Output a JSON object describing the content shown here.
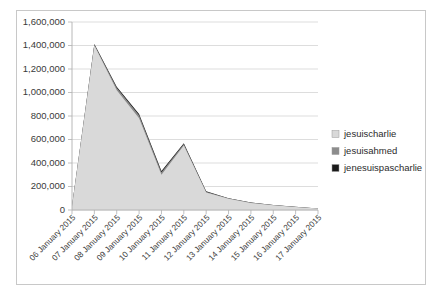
{
  "chart_data": {
    "type": "area",
    "stacked": true,
    "title": "",
    "subtitle": "",
    "xlabel": "",
    "ylabel": "",
    "grid": "horizontal",
    "legend_position": "right",
    "ylim": [
      0,
      1600000
    ],
    "ytick_values": [
      0,
      200000,
      400000,
      600000,
      800000,
      1000000,
      1200000,
      1400000,
      1600000
    ],
    "ytick_labels": [
      "0",
      "200,000",
      "400,000",
      "600,000",
      "800,000",
      "1,000,000",
      "1,200,000",
      "1,400,000",
      "1,600,000"
    ],
    "categories": [
      "06 January 2015",
      "07 January 2015",
      "08 January 2015",
      "09 January 2015",
      "10 January 2015",
      "11 January 2015",
      "12 January 2015",
      "13 January 2015",
      "14 January 2015",
      "15 January 2015",
      "16 January 2015",
      "17 January 2015"
    ],
    "series": [
      {
        "name": "jesuischarlie",
        "color": "#d9d9d9",
        "values": [
          30000,
          1400000,
          1020000,
          780000,
          300000,
          550000,
          150000,
          95000,
          60000,
          40000,
          25000,
          12000
        ]
      },
      {
        "name": "jesuisahmed",
        "color": "#8c8c8c",
        "values": [
          2000,
          8000,
          20000,
          26000,
          22000,
          12000,
          6000,
          4000,
          3000,
          2000,
          1500,
          1000
        ]
      },
      {
        "name": "jenesuispascharlie",
        "color": "#1a1a1a",
        "values": [
          1000,
          4000,
          9000,
          12000,
          10000,
          6000,
          3000,
          2000,
          1500,
          1000,
          800,
          500
        ]
      }
    ]
  },
  "legend": {
    "items": [
      {
        "label": "jesuischarlie",
        "color": "#d9d9d9"
      },
      {
        "label": "jesuisahmed",
        "color": "#8c8c8c"
      },
      {
        "label": "jenesuispascharlie",
        "color": "#1a1a1a"
      }
    ]
  }
}
